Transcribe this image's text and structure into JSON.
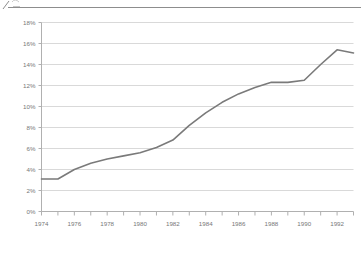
{
  "page": {
    "background_color": "#ffffff"
  },
  "header": {
    "rule_color": "#8d8d8d",
    "clipped_glyph_name": "clipped-logo-fragment"
  },
  "footer": {
    "note": ""
  },
  "chart_data": {
    "type": "line",
    "title": "",
    "subtitle": "",
    "xlabel": "",
    "ylabel": "",
    "x": [
      1974,
      1975,
      1976,
      1977,
      1978,
      1979,
      1980,
      1981,
      1982,
      1983,
      1984,
      1985,
      1986,
      1987,
      1988,
      1989,
      1990,
      1991,
      1992,
      1993
    ],
    "categories": [
      "1974",
      "1975",
      "1976",
      "1977",
      "1978",
      "1979",
      "1980",
      "1981",
      "1982",
      "1983",
      "1984",
      "1985",
      "1986",
      "1987",
      "1988",
      "1989",
      "1990",
      "1991",
      "1992",
      "1993"
    ],
    "values": [
      3.1,
      3.1,
      4.0,
      4.6,
      5.0,
      5.3,
      5.6,
      6.1,
      6.8,
      8.2,
      9.4,
      10.4,
      11.2,
      11.8,
      12.3,
      12.3,
      12.5,
      14.0,
      15.4,
      15.1
    ],
    "series": [
      {
        "name": "",
        "color": "#7a7a7a",
        "values": [
          3.1,
          3.1,
          4.0,
          4.6,
          5.0,
          5.3,
          5.6,
          6.1,
          6.8,
          8.2,
          9.4,
          10.4,
          11.2,
          11.8,
          12.3,
          12.3,
          12.5,
          14.0,
          15.4,
          15.1
        ]
      }
    ],
    "xlim": [
      1974,
      1993
    ],
    "ylim": [
      0,
      18
    ],
    "ytick_step": 2,
    "ytick_labels": [
      "0%",
      "2%",
      "4%",
      "6%",
      "8%",
      "10%",
      "12%",
      "14%",
      "16%",
      "18%"
    ],
    "ytick_values": [
      0,
      2,
      4,
      6,
      8,
      10,
      12,
      14,
      16,
      18
    ],
    "xtick_labels": [
      "1974",
      "1976",
      "1978",
      "1980",
      "1982",
      "1984",
      "1986",
      "1988",
      "1990",
      "1992"
    ],
    "xtick_values": [
      1974,
      1976,
      1978,
      1980,
      1982,
      1984,
      1986,
      1988,
      1990,
      1992
    ],
    "xminor_step": 1,
    "grid": {
      "horizontal": true,
      "vertical": false,
      "color": "#d9d9d9"
    },
    "axis_color": "#b0b0b0",
    "legend": {
      "visible": false,
      "position": "none",
      "entries": []
    },
    "annotations": []
  }
}
